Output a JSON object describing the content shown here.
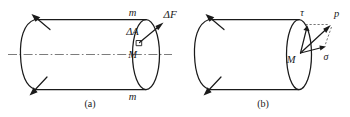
{
  "figure": {
    "kind": "line-drawing",
    "background_color": "#ffffff",
    "ink_color": "#1a1a1a",
    "axis_color": "#5a5a5a",
    "panels": [
      {
        "id": "a",
        "caption": "(a)",
        "labels": {
          "section_top": "m",
          "section_bottom": "m",
          "force": "ΔF",
          "area": "ΔA",
          "point": "M"
        },
        "has_centerline": true,
        "load_arrows": 2
      },
      {
        "id": "b",
        "caption": "(b)",
        "labels": {
          "shear": "τ",
          "resultant": "p",
          "point": "M",
          "normal": "σ"
        },
        "has_centerline": false,
        "load_arrows": 2
      }
    ]
  }
}
